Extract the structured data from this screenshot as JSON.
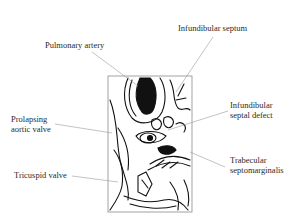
{
  "diagram": {
    "type": "anatomical-illustration",
    "labels": [
      {
        "id": "pulmonary-artery",
        "text": "Pulmonary artery"
      },
      {
        "id": "infundibular-septum",
        "text": "Infundibular septum"
      },
      {
        "id": "prolapsing-aortic-valve",
        "line1": "Prolapsing",
        "line2": "aortic valve"
      },
      {
        "id": "infundibular-septal-defect",
        "line1": "Infundibular",
        "line2": "septal defect"
      },
      {
        "id": "tricuspid-valve",
        "text": "Tricuspid valve"
      },
      {
        "id": "trabecular-septomarginalis",
        "line1": "Trabecular",
        "line2": "septomarginalis"
      }
    ],
    "colors": {
      "ink": "#111111",
      "leader": "#9a9a9a",
      "frame": "#8a8a8a",
      "text": "#2a2a2a"
    }
  }
}
